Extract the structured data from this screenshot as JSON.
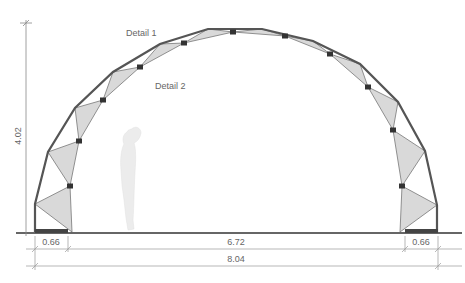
{
  "diagram": {
    "type": "arch structure elevation",
    "labels": {
      "detail1": "Detail 1",
      "detail2": "Detail 2"
    },
    "dimensions": {
      "height": "4.02",
      "left_support": "0.66",
      "inner_span": "6.72",
      "right_support": "0.66",
      "total_span": "8.04"
    },
    "colors": {
      "frame": "#555555",
      "panel_fill": "#d9d9d9",
      "panel_stroke": "#777777",
      "connector": "#333333",
      "dimension_line": "#888888",
      "ground": "#333333",
      "figure": "#ececec"
    },
    "outer_nodes": [
      [
        35,
        232
      ],
      [
        35,
        204
      ],
      [
        48,
        152
      ],
      [
        75,
        108
      ],
      [
        113,
        72
      ],
      [
        160,
        44
      ],
      [
        208,
        29
      ],
      [
        262,
        29
      ],
      [
        313,
        41
      ],
      [
        360,
        64
      ],
      [
        398,
        102
      ],
      [
        425,
        151
      ],
      [
        437,
        205
      ],
      [
        437,
        232
      ]
    ],
    "inner_nodes": [
      [
        72,
        232
      ],
      [
        70,
        186
      ],
      [
        79,
        141
      ],
      [
        103,
        100
      ],
      [
        140,
        67
      ],
      [
        184,
        43
      ],
      [
        233,
        32
      ],
      [
        285,
        36
      ],
      [
        330,
        54
      ],
      [
        368,
        87
      ],
      [
        393,
        130
      ],
      [
        402,
        186
      ],
      [
        400,
        232
      ]
    ]
  }
}
